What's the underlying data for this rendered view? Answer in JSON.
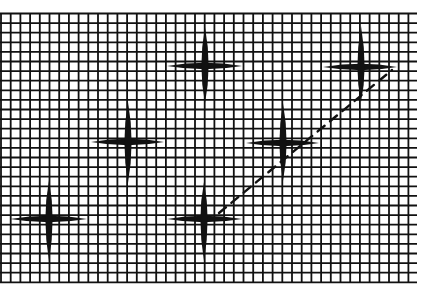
{
  "diagram": {
    "title": "Grid with cross marks and dashed line",
    "background_color": "#ffffff",
    "ink_color": "#111111",
    "grid": {
      "left": 1,
      "top": 13.5,
      "right": 417,
      "bottom": 282,
      "cell_width": 9.7,
      "cell_height": 9.6,
      "line_width": 1.8
    },
    "crosses": [
      {
        "id": "top-middle",
        "cx": 205,
        "cy": 66,
        "h_left": 167,
        "h_right": 242,
        "v_top": 27,
        "v_bottom": 103
      },
      {
        "id": "top-right",
        "cx": 361,
        "cy": 67,
        "h_left": 323,
        "h_right": 397,
        "v_top": 26,
        "v_bottom": 102
      },
      {
        "id": "middle-left",
        "cx": 128,
        "cy": 142,
        "h_left": 91,
        "h_right": 164,
        "v_top": 102,
        "v_bottom": 183
      },
      {
        "id": "middle-right",
        "cx": 283,
        "cy": 143,
        "h_left": 246,
        "h_right": 319,
        "v_top": 103,
        "v_bottom": 181
      },
      {
        "id": "bottom-left",
        "cx": 49,
        "cy": 219,
        "h_left": 10,
        "h_right": 87,
        "v_top": 180,
        "v_bottom": 261
      },
      {
        "id": "bottom-middle",
        "cx": 204,
        "cy": 219,
        "h_left": 167,
        "h_right": 242,
        "v_top": 182,
        "v_bottom": 261
      }
    ],
    "dashed_line": {
      "x1": 219,
      "y1": 213,
      "x2": 392,
      "y2": 70,
      "dash": "9 7",
      "width": 2.4
    }
  }
}
